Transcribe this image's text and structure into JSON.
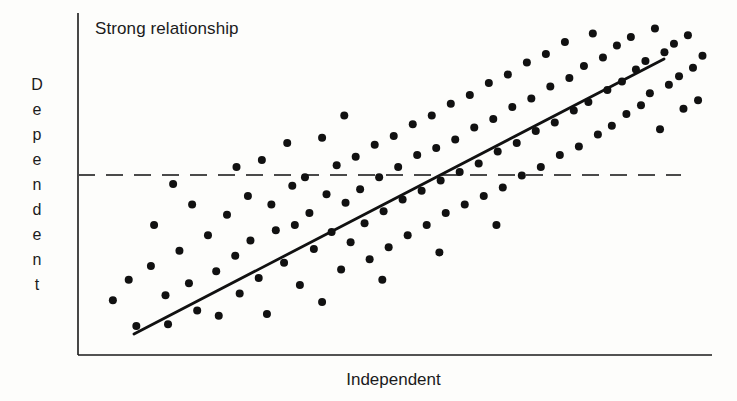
{
  "figure": {
    "width": 737,
    "height": 401,
    "background_color": "#fdfdfb",
    "ink_color": "#1a1a1a"
  },
  "chart_data": {
    "type": "scatter",
    "title": "Strong relationship",
    "xlabel": "Independent",
    "ylabel": "Dependent",
    "ylabel_letters": [
      "D",
      "e",
      "p",
      "e",
      "n",
      "d",
      "e",
      "n",
      "t"
    ],
    "grid": false,
    "legend": null,
    "axis_ticks": {
      "x": [],
      "y": []
    },
    "xlim": [
      0,
      100
    ],
    "ylim": [
      0,
      100
    ],
    "annotations": [
      {
        "name": "mean-reference-line",
        "type": "horizontal-dashed-line",
        "y": 57,
        "x_start": 0,
        "x_end": 95,
        "style": "dashed",
        "color": "#4a4a4a"
      },
      {
        "name": "regression-line",
        "type": "line-of-best-fit",
        "x_start": 9,
        "y_start": 6,
        "x_end": 92,
        "y_end": 86,
        "style": "solid",
        "color": "#111111"
      }
    ],
    "point_radius_px": 4,
    "point_color": "#111111",
    "n_points": 120,
    "points": [
      [
        5.5,
        16.0
      ],
      [
        9.2,
        8.5
      ],
      [
        11.5,
        26.0
      ],
      [
        13.8,
        17.5
      ],
      [
        14.2,
        9.0
      ],
      [
        16.0,
        30.5
      ],
      [
        17.5,
        21.0
      ],
      [
        18.8,
        13.0
      ],
      [
        20.5,
        35.0
      ],
      [
        21.8,
        24.5
      ],
      [
        22.2,
        11.5
      ],
      [
        23.5,
        41.0
      ],
      [
        24.8,
        29.0
      ],
      [
        25.5,
        18.0
      ],
      [
        26.8,
        46.5
      ],
      [
        27.2,
        33.5
      ],
      [
        28.5,
        22.5
      ],
      [
        29.8,
        12.0
      ],
      [
        30.5,
        44.0
      ],
      [
        31.2,
        36.5
      ],
      [
        32.5,
        27.0
      ],
      [
        33.8,
        49.5
      ],
      [
        34.2,
        38.0
      ],
      [
        35.0,
        20.5
      ],
      [
        35.8,
        52.0
      ],
      [
        36.5,
        41.5
      ],
      [
        37.2,
        31.0
      ],
      [
        38.5,
        15.5
      ],
      [
        39.2,
        47.0
      ],
      [
        40.0,
        36.0
      ],
      [
        40.8,
        55.5
      ],
      [
        41.5,
        25.0
      ],
      [
        42.2,
        44.5
      ],
      [
        43.0,
        33.0
      ],
      [
        43.8,
        58.0
      ],
      [
        44.5,
        48.5
      ],
      [
        45.2,
        38.5
      ],
      [
        46.0,
        28.0
      ],
      [
        46.8,
        61.5
      ],
      [
        47.5,
        52.0
      ],
      [
        48.2,
        42.0
      ],
      [
        49.0,
        31.5
      ],
      [
        49.8,
        64.0
      ],
      [
        50.5,
        55.0
      ],
      [
        51.2,
        45.5
      ],
      [
        52.0,
        35.0
      ],
      [
        52.8,
        67.5
      ],
      [
        53.5,
        58.5
      ],
      [
        54.2,
        48.0
      ],
      [
        55.0,
        38.0
      ],
      [
        55.8,
        70.0
      ],
      [
        56.5,
        60.5
      ],
      [
        57.2,
        51.0
      ],
      [
        58.0,
        41.5
      ],
      [
        58.8,
        73.5
      ],
      [
        59.5,
        63.0
      ],
      [
        60.2,
        53.5
      ],
      [
        61.0,
        44.0
      ],
      [
        61.8,
        76.0
      ],
      [
        62.5,
        66.5
      ],
      [
        63.2,
        56.0
      ],
      [
        64.0,
        46.5
      ],
      [
        64.8,
        79.5
      ],
      [
        65.5,
        69.0
      ],
      [
        66.2,
        59.5
      ],
      [
        67.0,
        49.0
      ],
      [
        67.8,
        82.0
      ],
      [
        68.5,
        72.5
      ],
      [
        69.2,
        62.0
      ],
      [
        70.0,
        52.5
      ],
      [
        70.8,
        85.5
      ],
      [
        71.5,
        75.0
      ],
      [
        72.2,
        65.5
      ],
      [
        73.0,
        55.0
      ],
      [
        73.8,
        88.0
      ],
      [
        74.5,
        78.5
      ],
      [
        75.2,
        68.0
      ],
      [
        76.0,
        58.5
      ],
      [
        76.8,
        91.5
      ],
      [
        77.5,
        81.0
      ],
      [
        78.2,
        71.5
      ],
      [
        79.0,
        61.0
      ],
      [
        79.8,
        84.5
      ],
      [
        80.5,
        74.0
      ],
      [
        81.2,
        94.0
      ],
      [
        82.0,
        64.5
      ],
      [
        82.8,
        87.0
      ],
      [
        83.5,
        77.5
      ],
      [
        84.2,
        67.0
      ],
      [
        85.0,
        90.5
      ],
      [
        85.8,
        80.0
      ],
      [
        86.5,
        70.5
      ],
      [
        87.2,
        93.0
      ],
      [
        88.0,
        83.5
      ],
      [
        88.8,
        73.0
      ],
      [
        89.5,
        86.0
      ],
      [
        90.2,
        76.5
      ],
      [
        91.0,
        95.5
      ],
      [
        91.8,
        66.0
      ],
      [
        92.5,
        88.5
      ],
      [
        93.2,
        79.0
      ],
      [
        94.0,
        91.0
      ],
      [
        94.8,
        81.5
      ],
      [
        95.5,
        72.0
      ],
      [
        96.2,
        93.5
      ],
      [
        97.0,
        84.0
      ],
      [
        97.8,
        74.5
      ],
      [
        98.5,
        87.5
      ],
      [
        12.0,
        38.0
      ],
      [
        18.0,
        44.0
      ],
      [
        25.0,
        55.0
      ],
      [
        33.0,
        62.0
      ],
      [
        42.0,
        70.0
      ],
      [
        8.0,
        22.0
      ],
      [
        15.0,
        50.0
      ],
      [
        29.0,
        57.0
      ],
      [
        38.5,
        63.5
      ],
      [
        48.0,
        22.0
      ],
      [
        57.0,
        30.0
      ],
      [
        66.0,
        38.0
      ]
    ]
  }
}
